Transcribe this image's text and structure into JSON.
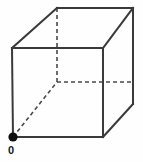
{
  "figure": {
    "type": "line-drawing",
    "background_color": "#fefefe",
    "stroke_color": "#3a3a3a",
    "hidden_stroke_color": "#4a4a4a",
    "dot_color": "#111111",
    "label_color": "#1a1a1a",
    "stroke_width": 2,
    "hidden_stroke_width": 1.6,
    "hidden_dash_pattern": "4,3",
    "canvas": {
      "width": 143,
      "height": 162
    }
  },
  "geometry": {
    "vertices": {
      "front_top_left": {
        "x": 12,
        "y": 48
      },
      "front_top_right": {
        "x": 103,
        "y": 48
      },
      "front_bottom_right": {
        "x": 103,
        "y": 137
      },
      "front_bottom_left": {
        "x": 13,
        "y": 137
      },
      "back_top_left": {
        "x": 57,
        "y": 8
      },
      "back_top_right": {
        "x": 133,
        "y": 8
      },
      "back_bottom_right": {
        "x": 133,
        "y": 104
      },
      "back_bottom_left": {
        "x": 57,
        "y": 82
      }
    },
    "visible_edges": [
      {
        "name": "front-top-edge",
        "from": "front_top_left",
        "to": "front_top_right"
      },
      {
        "name": "front-right-edge",
        "from": "front_top_right",
        "to": "front_bottom_right"
      },
      {
        "name": "front-bottom-edge",
        "from": "front_bottom_right",
        "to": "front_bottom_left"
      },
      {
        "name": "front-left-edge",
        "from": "front_bottom_left",
        "to": "front_top_left"
      },
      {
        "name": "back-top-edge",
        "from": "back_top_left",
        "to": "back_top_right"
      },
      {
        "name": "back-right-edge",
        "from": "back_top_right",
        "to": "back_bottom_right"
      },
      {
        "name": "top-left-diagonal",
        "from": "front_top_left",
        "to": "back_top_left"
      },
      {
        "name": "top-right-diagonal",
        "from": "front_top_right",
        "to": "back_top_right"
      },
      {
        "name": "bottom-right-diagonal",
        "from": "front_bottom_right",
        "to": "back_bottom_right"
      }
    ],
    "hidden_edges": [
      {
        "name": "back-left-vertical-hidden",
        "from": "back_top_left",
        "to": "back_bottom_left"
      },
      {
        "name": "back-bottom-horizontal-hidden",
        "from": "back_bottom_left",
        "to": "back_bottom_right"
      },
      {
        "name": "bottom-left-diagonal-hidden",
        "from": "front_bottom_left",
        "to": "back_bottom_left"
      }
    ],
    "markers": [
      {
        "name": "origin-dot",
        "x": 13,
        "y": 137,
        "radius": 4.6,
        "filled": true
      }
    ]
  },
  "labels": {
    "origin": "0"
  }
}
